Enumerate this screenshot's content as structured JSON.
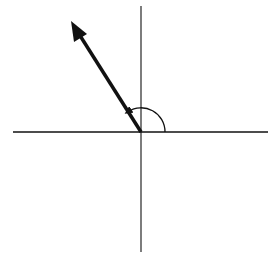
{
  "diagram": {
    "type": "angle-vector-diagram",
    "description": "Vector in standard position drawn from the origin into the second quadrant, with an arc marking the angle measured counterclockwise from the positive x-axis",
    "origin": {
      "x": 141,
      "y": 132
    },
    "axes": {
      "horizontal": {
        "x1": 13,
        "y1": 132,
        "x2": 268,
        "y2": 132
      },
      "vertical": {
        "x1": 141,
        "y1": 6,
        "x2": 141,
        "y2": 252
      }
    },
    "vector": {
      "x1": 141,
      "y1": 132,
      "x2": 71,
      "y2": 22,
      "approx_angle_deg": 122
    },
    "angle_arc": {
      "radius": 24,
      "start_deg": 0,
      "end_deg": 122,
      "direction": "counterclockwise",
      "arrowhead": "end"
    },
    "colors": {
      "line": "#111111",
      "background": "#ffffff"
    },
    "labels": []
  }
}
